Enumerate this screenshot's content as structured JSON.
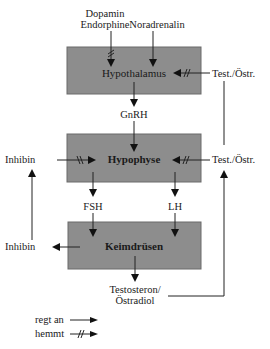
{
  "diagram": {
    "nodes": {
      "hypothalamus": "Hypothalamus",
      "hypophyse": "Hypophyse",
      "keimdruesen": "Keimdrüsen"
    },
    "labels": {
      "dopamin": "Dopamin",
      "endorphine": "Endorphine",
      "noradrenalin": "Noradrenalin",
      "test_oestr_top": "Test./Östr.",
      "gnrh": "GnRH",
      "inhibin_top": "Inhibin",
      "test_oestr_mid": "Test./Östr.",
      "fsh": "FSH",
      "lh": "LH",
      "inhibin_bottom": "Inhibin",
      "testosteron": "Testosteron/",
      "oestradiol": "Östradiol"
    },
    "edges": [
      {
        "from": "Dopamin Endorphine",
        "to": "Hypothalamus",
        "type": "hemmt"
      },
      {
        "from": "Noradrenalin",
        "to": "Hypothalamus",
        "type": "regt an"
      },
      {
        "from": "Test./Östr.",
        "to": "Hypothalamus",
        "type": "hemmt"
      },
      {
        "from": "Hypothalamus",
        "to": "GnRH",
        "type": "regt an"
      },
      {
        "from": "GnRH",
        "to": "Hypophyse",
        "type": "regt an"
      },
      {
        "from": "Inhibin",
        "to": "Hypophyse",
        "type": "hemmt"
      },
      {
        "from": "Test./Östr.",
        "to": "Hypophyse",
        "type": "hemmt"
      },
      {
        "from": "Hypophyse",
        "to": "FSH",
        "type": "regt an"
      },
      {
        "from": "Hypophyse",
        "to": "LH",
        "type": "regt an"
      },
      {
        "from": "FSH",
        "to": "Keimdrüsen",
        "type": "regt an"
      },
      {
        "from": "LH",
        "to": "Keimdrüsen",
        "type": "regt an"
      },
      {
        "from": "Keimdrüsen",
        "to": "Inhibin",
        "type": "regt an"
      },
      {
        "from": "Keimdrüsen",
        "to": "Testosteron/Östradiol",
        "type": "regt an"
      },
      {
        "from": "Inhibin",
        "to": "Inhibin (Hypophyse)",
        "type": "feedback"
      },
      {
        "from": "Testosteron/Östradiol",
        "to": "Test./Östr.",
        "type": "feedback"
      }
    ],
    "legend": {
      "stimulates": "regt an",
      "inhibits": "hemmt"
    }
  }
}
